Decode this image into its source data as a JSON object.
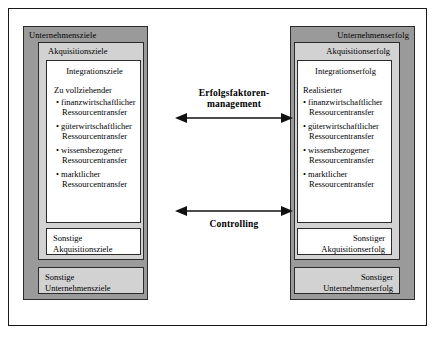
{
  "diagram": {
    "title_visible": false,
    "colors": {
      "level1_band": "#9a9a9a",
      "level2_band": "#d2d2d2",
      "level3_fill": "#ffffff",
      "border": "#2b2b2b",
      "page": "#ffffff"
    },
    "left_column": {
      "level1_label": "Unternehmensziele",
      "level2_label": "Akquisitionsziele",
      "level3_label": "Integrationsziele",
      "lead_text": "Zu vollziehender",
      "bullets": [
        {
          "line1": "finanzwirtschaftlicher",
          "line2": "Ressourcentransfer"
        },
        {
          "line1": "güterwirtschaftlicher",
          "line2": "Ressourcentransfer"
        },
        {
          "line1": "wissensbezogener",
          "line2": "Ressourcentransfer"
        },
        {
          "line1": "marktlicher",
          "line2": "Ressourcentransfer"
        }
      ],
      "sonstige_level2": {
        "line1": "Sonstige",
        "line2": "Akquisitionsziele"
      },
      "sonstige_level1": {
        "line1": "Sonstige",
        "line2": "Unternehmensziele"
      }
    },
    "right_column": {
      "level1_label": "Unternehmenserfolg",
      "level2_label": "Akquisitionserfolg",
      "level3_label": "Integrationserfolg",
      "lead_text": "Realisierter",
      "bullets": [
        {
          "line1": "finanzwirtschaftlicher",
          "line2": "Ressourcentransfer"
        },
        {
          "line1": "güterwirtschaftlicher",
          "line2": "Ressourcentransfer"
        },
        {
          "line1": "wissensbezogener",
          "line2": "Ressourcentransfer"
        },
        {
          "line1": "marktlicher",
          "line2": "Ressourcentransfer"
        }
      ],
      "sonstige_level2": {
        "line1": "Sonstiger",
        "line2": "Akquisitionserfolg"
      },
      "sonstige_level1": {
        "line1": "Sonstiger",
        "line2": "Unternehmenserfolg"
      }
    },
    "connectors": [
      {
        "id": "erfolgsfaktorenmanagement",
        "label_line1": "Erfolgsfaktoren-",
        "label_line2": "management",
        "direction": "bidirectional"
      },
      {
        "id": "controlling",
        "label_line1": "Controlling",
        "label_line2": "",
        "direction": "bidirectional"
      }
    ],
    "bullet_glyph": "•"
  }
}
